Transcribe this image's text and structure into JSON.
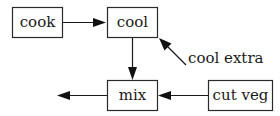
{
  "diagram": {
    "type": "flowchart",
    "nodes": [
      {
        "id": "cook",
        "label": "cook"
      },
      {
        "id": "cool",
        "label": "cool"
      },
      {
        "id": "mix",
        "label": "mix"
      },
      {
        "id": "cut_veg",
        "label": "cut veg"
      }
    ],
    "free_labels": [
      {
        "id": "cool_extra",
        "label": "cool extra"
      }
    ],
    "edges": [
      {
        "from": "cook",
        "to": "cool"
      },
      {
        "from": "cool",
        "to": "mix"
      },
      {
        "from": "cool_extra",
        "to": "cool"
      },
      {
        "from": "cut_veg",
        "to": "mix"
      },
      {
        "from": "mix",
        "to": "output"
      }
    ],
    "colors": {
      "stroke": "#1a1a1a",
      "background": "#ffffff"
    }
  }
}
